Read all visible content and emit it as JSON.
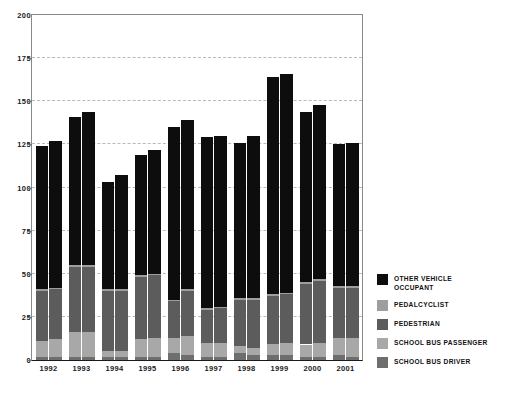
{
  "chart_data": {
    "type": "bar",
    "stacked": true,
    "title": "",
    "subtitle": "",
    "xlabel": "",
    "ylabel": "",
    "ylim": [
      0,
      200
    ],
    "yticks": [
      0,
      25,
      50,
      75,
      100,
      125,
      150,
      175,
      200
    ],
    "grid": "horizontal-dashed",
    "legend_position": "right",
    "categories": [
      "1992",
      "1993",
      "1994",
      "1995",
      "1996",
      "1997",
      "1998",
      "1999",
      "2000",
      "2001"
    ],
    "bars_per_category": 2,
    "series": [
      {
        "name": "SCHOOL BUS DRIVER",
        "color": "#6e6e6e",
        "values_a": [
          2,
          2,
          2,
          2,
          4,
          2,
          4,
          3,
          2,
          3
        ],
        "values_b": [
          2,
          2,
          2,
          2,
          3,
          2,
          3,
          3,
          2,
          2
        ]
      },
      {
        "name": "SCHOOL BUS PASSENGER",
        "color": "#a8a8a8",
        "values_a": [
          9,
          14,
          3,
          10,
          9,
          8,
          4,
          6,
          7,
          10
        ],
        "values_b": [
          10,
          14,
          3,
          11,
          11,
          8,
          4,
          7,
          8,
          11
        ]
      },
      {
        "name": "PEDESTRIAN",
        "color": "#5c5c5c",
        "values_a": [
          29,
          38,
          35,
          36,
          21,
          19,
          27,
          28,
          35,
          29
        ],
        "values_b": [
          29,
          38,
          35,
          36,
          26,
          20,
          28,
          28,
          36,
          29
        ]
      },
      {
        "name": "PEDALCYCLIST",
        "color": "#9e9e9e",
        "values_a": [
          1,
          1,
          1,
          1,
          1,
          1,
          1,
          1,
          1,
          1
        ],
        "values_b": [
          1,
          1,
          1,
          1,
          1,
          1,
          1,
          1,
          1,
          1
        ]
      },
      {
        "name": "OTHER VEHICLE\nOCCUPANT",
        "color": "#0d0d0d",
        "values_a": [
          83,
          86,
          62,
          70,
          100,
          99,
          90,
          126,
          99,
          82
        ],
        "values_b": [
          85,
          89,
          66,
          72,
          98,
          99,
          94,
          127,
          101,
          83
        ]
      }
    ],
    "totals_a": [
      124,
      141,
      103,
      119,
      135,
      129,
      126,
      164,
      144,
      125
    ],
    "totals_b": [
      127,
      144,
      107,
      123,
      139,
      131,
      130,
      166,
      147,
      126
    ]
  },
  "legend": {
    "items": [
      {
        "label": "OTHER VEHICLE\nOCCUPANT",
        "color": "#0d0d0d",
        "name": "other-vehicle-occupant"
      },
      {
        "label": "PEDALCYCLIST",
        "color": "#9e9e9e",
        "name": "pedalcyclist"
      },
      {
        "label": "PEDESTRIAN",
        "color": "#5c5c5c",
        "name": "pedestrian"
      },
      {
        "label": "SCHOOL BUS PASSENGER",
        "color": "#a8a8a8",
        "name": "school-bus-passenger"
      },
      {
        "label": "SCHOOL BUS DRIVER",
        "color": "#6e6e6e",
        "name": "school-bus-driver"
      }
    ]
  }
}
